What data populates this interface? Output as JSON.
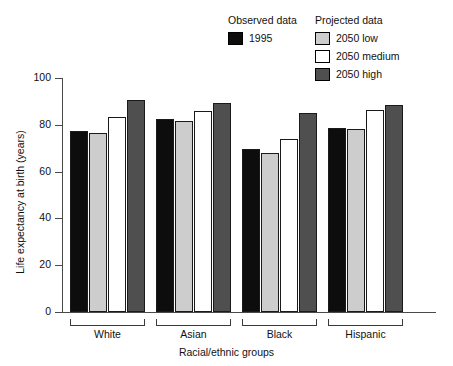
{
  "legend": {
    "groups": [
      {
        "title": "Observed data",
        "entries": [
          {
            "label": "1995",
            "color": "#0d0d0d"
          }
        ]
      },
      {
        "title": "Projected data",
        "entries": [
          {
            "label": "2050 low",
            "color": "#cdcdcd"
          },
          {
            "label": "2050 medium",
            "color": "#ffffff"
          },
          {
            "label": "2050 high",
            "color": "#4f4f4f"
          }
        ]
      }
    ]
  },
  "chart_data": {
    "type": "bar",
    "title": "",
    "xlabel": "Racial/ethnic groups",
    "ylabel": "Life expectancy at birth (years)",
    "ylim": [
      0,
      100
    ],
    "yticks": [
      0,
      20,
      40,
      60,
      80,
      100
    ],
    "grid": false,
    "legend_position": "top-right",
    "categories": [
      "White",
      "Asian",
      "Black",
      "Hispanic"
    ],
    "series": [
      {
        "name": "1995",
        "color": "#0d0d0d",
        "values": [
          77.5,
          82.5,
          69.5,
          78.5
        ]
      },
      {
        "name": "2050 low",
        "color": "#cdcdcd",
        "values": [
          76.5,
          81.5,
          68.0,
          78.0
        ]
      },
      {
        "name": "2050 medium",
        "color": "#ffffff",
        "values": [
          83.5,
          86.0,
          74.0,
          86.5
        ]
      },
      {
        "name": "2050 high",
        "color": "#4f4f4f",
        "values": [
          90.5,
          89.5,
          85.0,
          88.5
        ]
      }
    ]
  }
}
